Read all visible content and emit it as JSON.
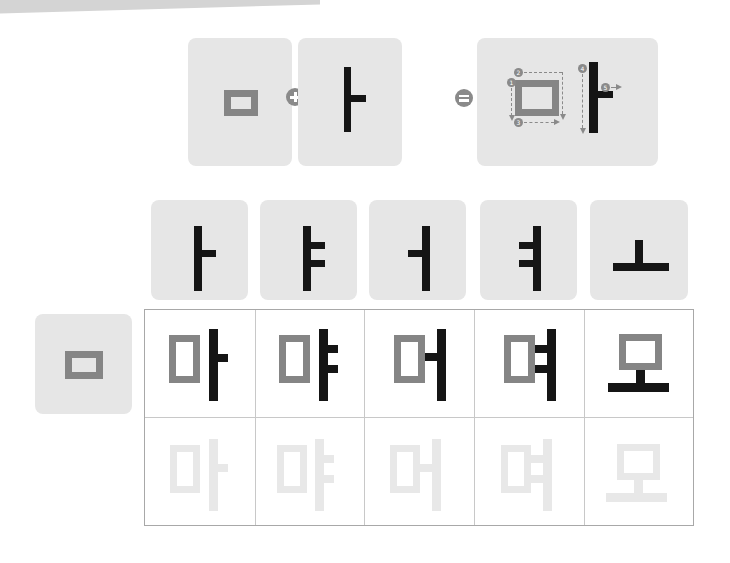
{
  "lesson": {
    "topic": "Korean Hangul: consonant ㅁ combined with vowels",
    "equation": {
      "consonant": "ㅁ",
      "plus": "+",
      "vowel": "ㅏ",
      "equals": "=",
      "result": "마",
      "stroke_order_numbers": [
        "1",
        "2",
        "3",
        "4",
        "5"
      ]
    },
    "vowels": [
      "ㅏ",
      "ㅑ",
      "ㅓ",
      "ㅕ",
      "ㅗ"
    ],
    "row_consonant": "ㅁ",
    "syllables": [
      "마",
      "먀",
      "머",
      "며",
      "모"
    ],
    "tracing_syllables": [
      "마",
      "먀",
      "머",
      "며",
      "모"
    ]
  },
  "colors": {
    "card_bg": "#e6e6e6",
    "consonant_gray": "#858585",
    "vowel_black": "#151515",
    "trace_gray": "#e8e8e8",
    "grid_line": "#c8c8c8"
  }
}
